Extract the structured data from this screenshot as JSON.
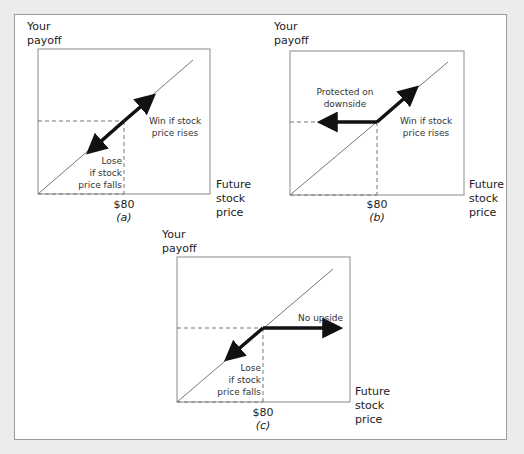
{
  "figure": {
    "panels": [
      {
        "id": "a",
        "caption": "(a)",
        "y_axis_label": [
          "Your",
          "payoff"
        ],
        "x_axis_label": [
          "Future",
          "stock",
          "price"
        ],
        "strike_label": "$80",
        "annotations": {
          "upper": [
            "Win if stock",
            "price rises"
          ],
          "lower": [
            "Lose",
            "if stock",
            "price falls"
          ]
        },
        "payoff_shape": "linear"
      },
      {
        "id": "b",
        "caption": "(b)",
        "y_axis_label": [
          "Your",
          "payoff"
        ],
        "x_axis_label": [
          "Future",
          "stock",
          "price"
        ],
        "strike_label": "$80",
        "annotations": {
          "upper": [
            "Protected on",
            "downside"
          ],
          "right": [
            "Win if stock",
            "price rises"
          ]
        },
        "payoff_shape": "floor-below-strike"
      },
      {
        "id": "c",
        "caption": "(c)",
        "y_axis_label": [
          "Your",
          "payoff"
        ],
        "x_axis_label": [
          "Future",
          "stock",
          "price"
        ],
        "strike_label": "$80",
        "annotations": {
          "upper": [
            "No upside"
          ],
          "lower": [
            "Lose",
            "if stock",
            "price falls"
          ]
        },
        "payoff_shape": "cap-above-strike"
      }
    ]
  }
}
